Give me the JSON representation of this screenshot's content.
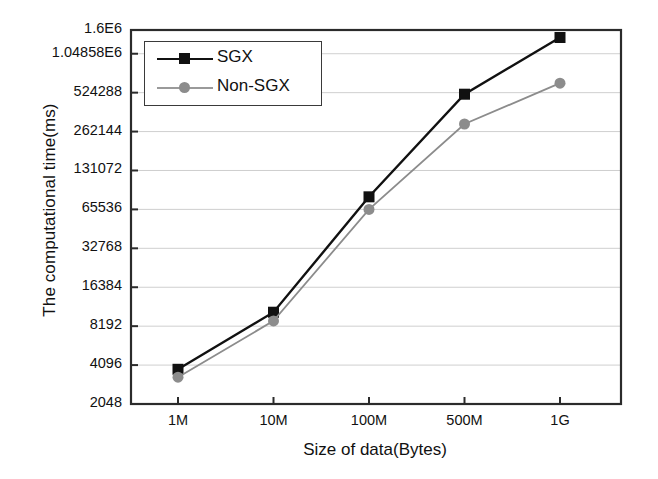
{
  "chart_data": {
    "type": "line",
    "title": "",
    "xlabel": "Size of data(Bytes)",
    "ylabel": "The computational time(ms)",
    "categories": [
      "1M",
      "10M",
      "100M",
      "500M",
      "1G"
    ],
    "yscale": "log2",
    "yticks": [
      2048,
      4096,
      8192,
      16384,
      32768,
      65536,
      131072,
      262144,
      524288,
      1048580,
      1600000
    ],
    "ytick_labels": [
      "2048",
      "4096",
      "8192",
      "16384",
      "32768",
      "65536",
      "131072",
      "262144",
      "524288",
      "1.04858E6",
      "1.6E6"
    ],
    "ylim": [
      2048,
      1600000
    ],
    "grid": true,
    "legend_position": "upper-left-inside",
    "series": [
      {
        "name": "SGX",
        "color": "#111111",
        "marker": "square",
        "values": [
          3800,
          10500,
          82000,
          510000,
          1400000
        ]
      },
      {
        "name": "Non-SGX",
        "color": "#8c8c8c",
        "marker": "circle",
        "values": [
          3300,
          9000,
          65536,
          300000,
          620000
        ]
      }
    ]
  },
  "legend": {
    "items": [
      {
        "label": "SGX"
      },
      {
        "label": "Non-SGX"
      }
    ]
  },
  "axes": {
    "y_title": "The computational time(ms)",
    "x_title": "Size of data(Bytes)",
    "y_labels": [
      "1.6E6",
      "1.04858E6",
      "524288",
      "262144",
      "131072",
      "65536",
      "32768",
      "16384",
      "8192",
      "4096",
      "2048"
    ],
    "x_labels": [
      "1M",
      "10M",
      "100M",
      "500M",
      "1G"
    ]
  }
}
